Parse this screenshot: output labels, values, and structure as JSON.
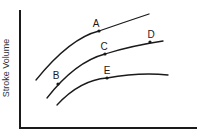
{
  "diagram": {
    "title": "",
    "y_axis_label": "Stroke Volume",
    "x_axis_label": "",
    "curves": [
      {
        "name": "upper-curve",
        "points": [
          "A"
        ]
      },
      {
        "name": "middle-curve",
        "points": [
          "B",
          "C",
          "D"
        ]
      },
      {
        "name": "lower-curve",
        "points": [
          "E"
        ]
      }
    ],
    "points": {
      "A": {
        "label": "A",
        "curve": "upper-curve"
      },
      "B": {
        "label": "B",
        "curve": "middle-curve"
      },
      "C": {
        "label": "C",
        "curve": "middle-curve"
      },
      "D": {
        "label": "D",
        "curve": "middle-curve"
      },
      "E": {
        "label": "E",
        "curve": "lower-curve"
      }
    },
    "colors": {
      "line": "#1a1a1a",
      "background": "#ffffff"
    }
  }
}
